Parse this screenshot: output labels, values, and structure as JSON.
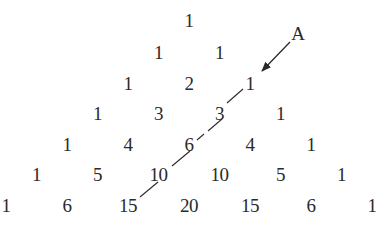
{
  "diagram": {
    "rows": [
      [
        "1"
      ],
      [
        "1",
        "1"
      ],
      [
        "1",
        "2",
        "1"
      ],
      [
        "1",
        "3",
        "3",
        "1"
      ],
      [
        "1",
        "4",
        "6",
        "4",
        "1"
      ],
      [
        "1",
        "5",
        "10",
        "10",
        "5",
        "1"
      ],
      [
        "1",
        "6",
        "15",
        "20",
        "15",
        "6",
        "1"
      ]
    ],
    "annotation": {
      "label": "A",
      "points_to": "row 2, last entry (1)"
    },
    "highlighted_diagonal": {
      "style": "dashed",
      "entries": [
        "1",
        "3",
        "6",
        "10",
        "15"
      ]
    },
    "colors": {
      "text": "#2a2a2a",
      "line": "#2a2a2a",
      "background": "#ffffff"
    }
  }
}
